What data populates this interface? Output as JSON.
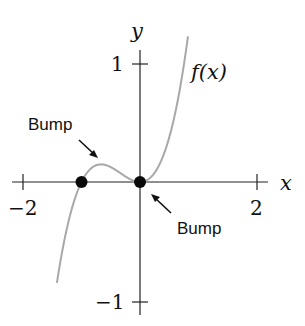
{
  "chart_data": {
    "type": "line",
    "title": "",
    "function_label": "f(x)",
    "xlabel": "x",
    "ylabel": "y",
    "xlim": [
      -2.2,
      2.2
    ],
    "ylim": [
      -1.15,
      1.1
    ],
    "x_ticks": [
      -2,
      2
    ],
    "x_tick_labels": [
      "−2",
      "2"
    ],
    "y_ticks": [
      1,
      -1
    ],
    "y_tick_labels": [
      "1",
      "−1"
    ],
    "grid": false,
    "legend": null,
    "series": [
      {
        "name": "f(x)",
        "formula_estimate": "x^3 + x^2",
        "color": "#a8a8a8",
        "x": [
          -1.4,
          -1.2,
          -1.0,
          -0.8,
          -0.667,
          -0.5,
          -0.3,
          0.0,
          0.2,
          0.4,
          0.6,
          0.8
        ],
        "y": [
          -0.78,
          -0.29,
          0.0,
          0.128,
          0.148,
          0.125,
          0.063,
          0.0,
          0.048,
          0.224,
          0.576,
          1.152
        ]
      }
    ],
    "points": [
      {
        "x": -1,
        "y": 0,
        "label": "root"
      },
      {
        "x": 0,
        "y": 0,
        "label": "root (double)"
      }
    ],
    "annotations": [
      {
        "text": "Bump",
        "target_x": -0.667,
        "target_y": 0.148,
        "position": "upper-left"
      },
      {
        "text": "Bump",
        "target_x": 0,
        "target_y": 0,
        "position": "lower-right"
      }
    ]
  }
}
